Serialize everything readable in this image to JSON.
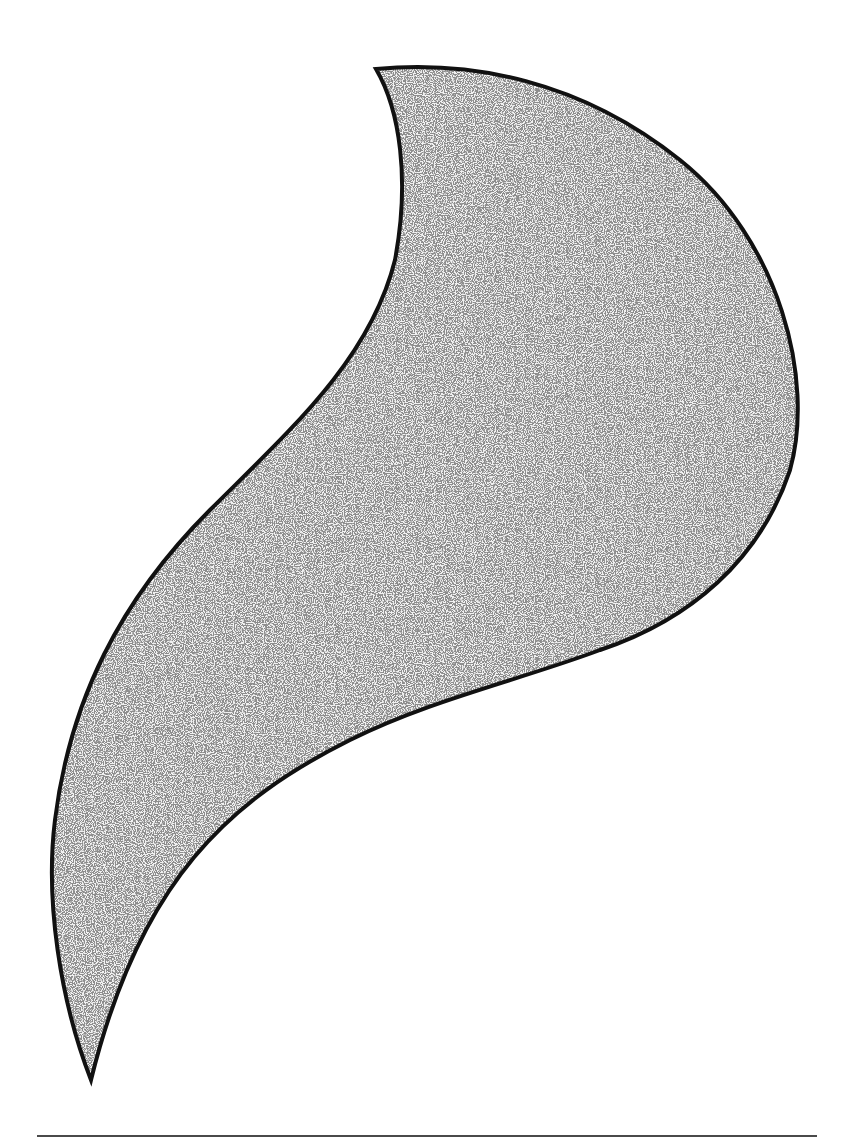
{
  "figure": {
    "shape_path": "M 376 69 C 470 60 580 80 680 160 C 780 240 815 380 790 470 C 760 560 690 620 600 650 C 520 680 430 700 350 740 C 230 800 140 880 91 1080 C 60 1000 45 900 55 820 C 70 700 120 600 210 510 C 290 430 370 360 395 260 C 410 180 400 110 376 69 Z",
    "fill_color": "#ececec",
    "stipple_color": "#3a3a3a",
    "outline_color": "#111111",
    "outline_width": 4
  },
  "rule": {
    "color": "#4a4a4a",
    "x_start": 37,
    "x_end": 817,
    "y": 1136
  }
}
